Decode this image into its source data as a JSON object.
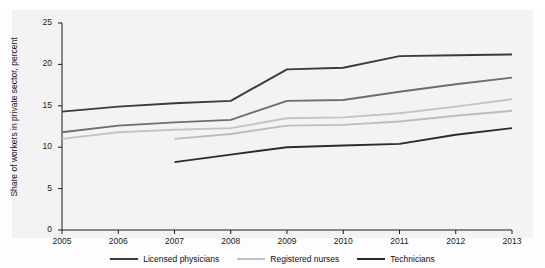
{
  "chart_data": {
    "type": "line",
    "title": "",
    "xlabel": "",
    "ylabel": "Share of workers in private sector, percent",
    "x": [
      2005,
      2006,
      2007,
      2008,
      2009,
      2010,
      2011,
      2012,
      2013
    ],
    "xtick_labels": [
      "2005",
      "2006",
      "2007",
      "2008",
      "2009",
      "2010",
      "2011",
      "2012",
      "2013"
    ],
    "ytick_labels": [
      "0",
      "5",
      "10",
      "15",
      "20",
      "25"
    ],
    "yticks": [
      0,
      5,
      10,
      15,
      20,
      25
    ],
    "ylim": [
      0,
      25
    ],
    "xlim": [
      2005,
      2013
    ],
    "grid": false,
    "legend_position": "bottom",
    "series": [
      {
        "name": "Licensed physicians (upper)",
        "legend_group": "Licensed physicians",
        "color": "#3b3b3b",
        "x": [
          2005,
          2006,
          2007,
          2008,
          2009,
          2010,
          2011,
          2012,
          2013
        ],
        "values": [
          14.3,
          14.9,
          15.3,
          15.6,
          19.4,
          19.6,
          21.0,
          21.1,
          21.2
        ]
      },
      {
        "name": "Licensed physicians (lower)",
        "legend_group": "Licensed physicians",
        "color": "#6e6e6e",
        "x": [
          2005,
          2006,
          2007,
          2008,
          2009,
          2010,
          2011,
          2012,
          2013
        ],
        "values": [
          11.8,
          12.6,
          13.0,
          13.3,
          15.6,
          15.7,
          16.7,
          17.6,
          18.4
        ]
      },
      {
        "name": "Registered nurses (upper)",
        "legend_group": "Registered nurses",
        "color": "#c4c4c4",
        "x": [
          2005,
          2006,
          2007,
          2008,
          2009,
          2010,
          2011,
          2012,
          2013
        ],
        "values": [
          11.0,
          11.8,
          12.1,
          12.3,
          13.5,
          13.6,
          14.1,
          14.9,
          15.8
        ]
      },
      {
        "name": "Registered nurses (lower)",
        "legend_group": "Registered nurses",
        "color": "#bdbdbd",
        "x": [
          2007,
          2008,
          2009,
          2010,
          2011,
          2012,
          2013
        ],
        "values": [
          11.0,
          11.6,
          12.6,
          12.7,
          13.1,
          13.8,
          14.4
        ]
      },
      {
        "name": "Technicians",
        "legend_group": "Technicians",
        "color": "#2b2b2b",
        "x": [
          2007,
          2008,
          2009,
          2010,
          2011,
          2012,
          2013
        ],
        "values": [
          8.2,
          9.1,
          10.0,
          10.2,
          10.4,
          11.5,
          12.3
        ]
      }
    ],
    "legend": [
      {
        "label": "Licensed physicians",
        "color": "#3b3b3b"
      },
      {
        "label": "Registered nurses",
        "color": "#c4c4c4"
      },
      {
        "label": "Technicians",
        "color": "#2b2b2b"
      }
    ]
  },
  "axis": {
    "ylabel": "Share of workers in private sector, percent"
  }
}
